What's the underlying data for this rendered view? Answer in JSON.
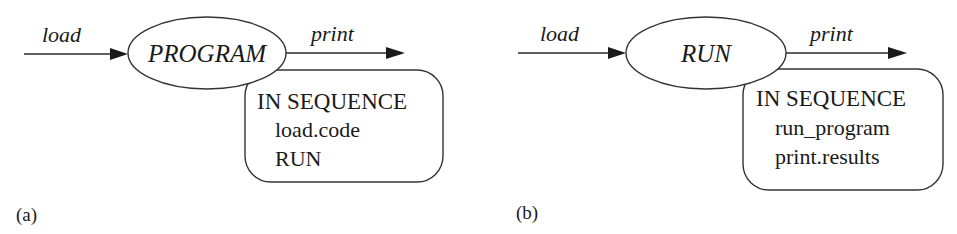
{
  "figure": {
    "panels": [
      {
        "id": "a",
        "caption": "(a)",
        "input_arrow": {
          "label": "load"
        },
        "process": {
          "label": "PROGRAM"
        },
        "output_arrow": {
          "label": "print"
        },
        "annotation_box": {
          "heading": "IN SEQUENCE",
          "lines": [
            "load.code",
            "RUN"
          ]
        }
      },
      {
        "id": "b",
        "caption": "(b)",
        "input_arrow": {
          "label": "load"
        },
        "process": {
          "label": "RUN"
        },
        "output_arrow": {
          "label": "print"
        },
        "annotation_box": {
          "heading": "IN SEQUENCE",
          "lines": [
            "run_program",
            "print.results"
          ]
        }
      }
    ]
  }
}
